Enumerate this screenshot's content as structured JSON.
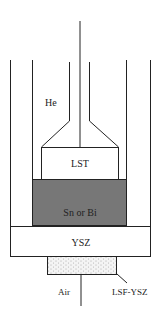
{
  "labels": {
    "he": "He",
    "lst": "LST",
    "metal": "Sn or Bi",
    "ysz": "YSZ",
    "lsf_ysz": "LSF-YSZ",
    "air": "Air"
  },
  "colors": {
    "line": "#222222",
    "metal_fill": "#777777",
    "background": "#ffffff",
    "cathode_fill": "#f2f2f2"
  }
}
